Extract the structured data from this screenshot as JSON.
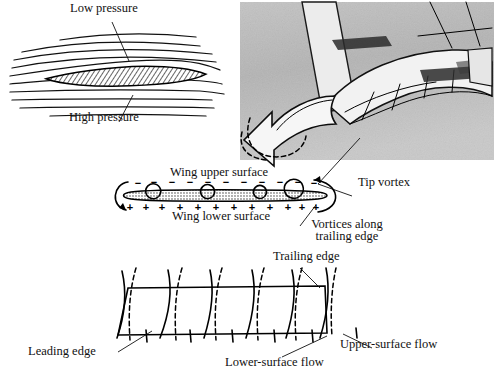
{
  "figure": {
    "panels": [
      {
        "id": "airfoil-section",
        "name": "Airfoil cross-section with streamlines"
      },
      {
        "id": "wingtip-photo",
        "name": "Wingtip vortex photograph"
      },
      {
        "id": "spanwise-section",
        "name": "Spanwise pressure and vortex sheet"
      },
      {
        "id": "planform",
        "name": "Wing planform surface flow directions"
      }
    ]
  },
  "labels": {
    "low_pressure": "Low pressure",
    "high_pressure": "High pressure",
    "wing_upper_surface": "Wing upper surface",
    "wing_lower_surface": "Wing lower surface",
    "tip_vortex": "Tip vortex",
    "vortices_along": "Vortices along",
    "trailing_edge_2": "trailing edge",
    "trailing_edge": "Trailing edge",
    "leading_edge": "Leading edge",
    "lower_surface_flow": "Lower-surface flow",
    "upper_surface_flow": "Upper-surface flow"
  },
  "signs": {
    "upper": "−",
    "lower": "+",
    "upper_count": 11,
    "lower_count": 12
  },
  "colors": {
    "ink": "#111111",
    "paper": "#ffffff",
    "photo_gray": "#b9b9b9",
    "hatch": "#333333"
  },
  "icons": {
    "vortex": "vortex-circle-icon",
    "tip_arrow": "curved-arrow-icon",
    "flow_arrow": "flow-arrow-icon"
  }
}
